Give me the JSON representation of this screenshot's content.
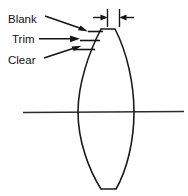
{
  "figure": {
    "background_color": "#ffffff",
    "line_color": "#1a1a1a",
    "text_color": "#111111",
    "width": 188,
    "height": 196
  },
  "labels": {
    "blank": "Blank",
    "trim": "Trim",
    "clear": "Clear"
  },
  "annotations": {
    "center_thickness_label": "",
    "dimension_note": ""
  },
  "diagram_data": {
    "type": "technical-drawing",
    "element": "biconvex lens cross-section",
    "lens": {
      "left_edge_x": 78,
      "right_edge_x": 134,
      "top_y": 29,
      "bottom_y": 189,
      "flat_top_width": 14,
      "flat_bottom_width": 14
    },
    "optical_axis_y": 112,
    "optical_axis_x_start": 23,
    "optical_axis_x_end": 184,
    "aperture_ticks": [
      {
        "name": "blank",
        "y": 32,
        "x_start": 88,
        "x_end": 103
      },
      {
        "name": "trim",
        "y": 41,
        "x_start": 81,
        "x_end": 99
      },
      {
        "name": "clear",
        "y": 49,
        "x_start": 76,
        "x_end": 94
      }
    ],
    "leaders": [
      {
        "name": "blank",
        "from_x": 44,
        "from_y": 16,
        "to_x": 87,
        "to_y": 31
      },
      {
        "name": "trim",
        "from_x": 39,
        "from_y": 39,
        "to_x": 79,
        "to_y": 39
      },
      {
        "name": "clear",
        "from_x": 44,
        "from_y": 57,
        "to_x": 80,
        "to_y": 46
      }
    ],
    "center_thickness_dimension": {
      "left_witness_x": 107,
      "right_witness_x": 119,
      "witness_top_y": 10,
      "witness_bottom_y": 26,
      "arrow_y": 17,
      "left_arrow_tail_x": 93,
      "right_arrow_tail_x": 133
    }
  }
}
